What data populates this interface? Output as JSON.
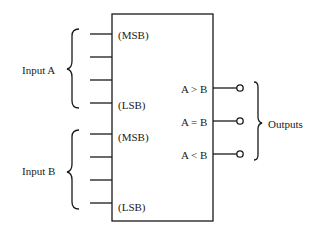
{
  "diagram": {
    "groups": {
      "input_a": "Input A",
      "input_b": "Input B",
      "outputs": "Outputs"
    },
    "pin_labels": {
      "a_msb": "(MSB)",
      "a_lsb": "(LSB)",
      "b_msb": "(MSB)",
      "b_lsb": "(LSB)"
    },
    "output_labels": [
      "A > B",
      "A = B",
      "A < B"
    ],
    "colors": {
      "line": "#1a1a1a",
      "background": "#ffffff"
    }
  }
}
